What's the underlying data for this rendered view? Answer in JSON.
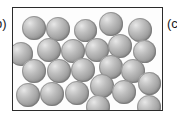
{
  "figure": {
    "caption_left": "b)",
    "caption_right": "(c",
    "panel_id": "b",
    "state_depicted": "liquid",
    "particle_count": 24,
    "colors": {
      "frame_border": "#2b2b2b",
      "background": "#ffffff",
      "particle_highlight": "#e8e8e8",
      "particle_midtone": "#a8a8a8",
      "particle_shadow": "#7d7d7d"
    },
    "box": {
      "x": 12,
      "y": 7,
      "width": 151,
      "height": 104,
      "border_width": 1.5
    }
  },
  "particles": [
    {
      "id": 1,
      "cx": 33,
      "cy": 27,
      "d": 24
    },
    {
      "id": 2,
      "cx": 57,
      "cy": 28,
      "d": 24
    },
    {
      "id": 3,
      "cx": 84,
      "cy": 29,
      "d": 23
    },
    {
      "id": 4,
      "cx": 110,
      "cy": 23,
      "d": 24
    },
    {
      "id": 5,
      "cx": 139,
      "cy": 29,
      "d": 24
    },
    {
      "id": 6,
      "cx": 48,
      "cy": 49,
      "d": 24
    },
    {
      "id": 7,
      "cx": 72,
      "cy": 50,
      "d": 24
    },
    {
      "id": 8,
      "cx": 96,
      "cy": 49,
      "d": 24
    },
    {
      "id": 9,
      "cx": 119,
      "cy": 45,
      "d": 24
    },
    {
      "id": 10,
      "cx": 143,
      "cy": 50,
      "d": 23
    },
    {
      "id": 11,
      "cx": 20,
      "cy": 53,
      "d": 24
    },
    {
      "id": 12,
      "cx": 33,
      "cy": 70,
      "d": 24
    },
    {
      "id": 13,
      "cx": 58,
      "cy": 70,
      "d": 24
    },
    {
      "id": 14,
      "cx": 82,
      "cy": 69,
      "d": 24
    },
    {
      "id": 15,
      "cx": 110,
      "cy": 66,
      "d": 24
    },
    {
      "id": 16,
      "cx": 132,
      "cy": 70,
      "d": 24
    },
    {
      "id": 17,
      "cx": 101,
      "cy": 85,
      "d": 24
    },
    {
      "id": 18,
      "cx": 148,
      "cy": 82,
      "d": 23
    },
    {
      "id": 19,
      "cx": 27,
      "cy": 94,
      "d": 24
    },
    {
      "id": 20,
      "cx": 51,
      "cy": 93,
      "d": 24
    },
    {
      "id": 21,
      "cx": 76,
      "cy": 92,
      "d": 24
    },
    {
      "id": 22,
      "cx": 123,
      "cy": 91,
      "d": 24
    },
    {
      "id": 23,
      "cx": 97,
      "cy": 106,
      "d": 24
    },
    {
      "id": 24,
      "cx": 148,
      "cy": 106,
      "d": 24
    }
  ]
}
